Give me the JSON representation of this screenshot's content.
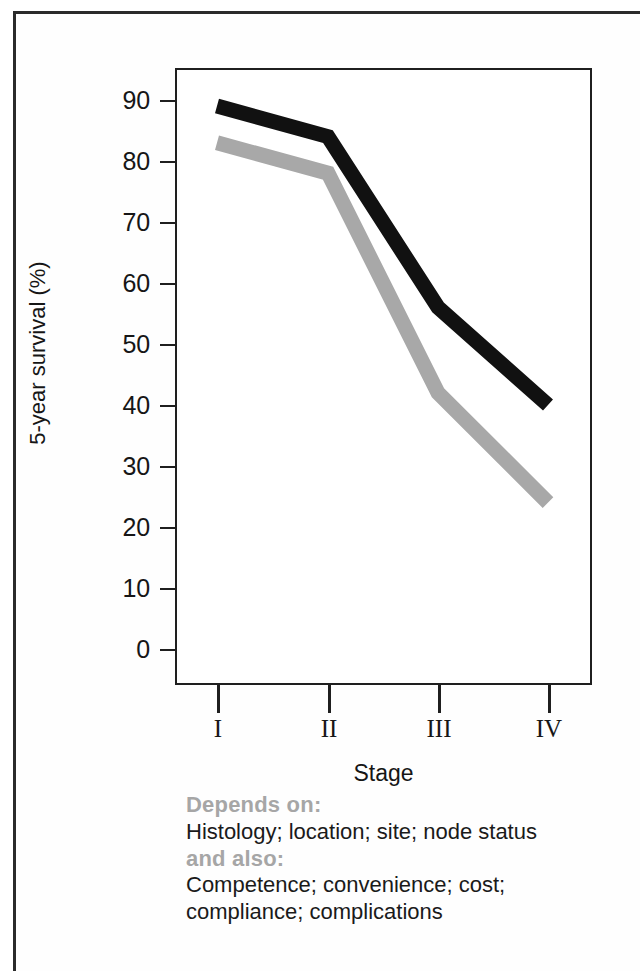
{
  "figure": {
    "axis_color": "#1f1f1f",
    "series_colors": {
      "primary": "#111111",
      "secondary": "#a8a8a8"
    },
    "annotation_heading_color": "#a6a6a6"
  },
  "chart_data": {
    "type": "line",
    "title": "",
    "xlabel": "Stage",
    "ylabel": "5-year survival (%)",
    "categories": [
      "I",
      "II",
      "III",
      "IV"
    ],
    "x_tick_labels": [
      "I",
      "II",
      "III",
      "IV"
    ],
    "y_tick_labels": [
      "0",
      "10",
      "20",
      "30",
      "40",
      "50",
      "60",
      "70",
      "80",
      "90"
    ],
    "y_ticks": [
      0,
      10,
      20,
      30,
      40,
      50,
      60,
      70,
      80,
      90
    ],
    "ylim": [
      -5,
      95
    ],
    "grid": false,
    "legend": "none",
    "series": [
      {
        "name": "upper",
        "color": "#111111",
        "values": [
          89,
          84,
          56,
          40
        ]
      },
      {
        "name": "lower",
        "color": "#a8a8a8",
        "values": [
          83,
          78,
          42,
          24
        ]
      }
    ]
  },
  "annotations": {
    "line1_heading": "Depends on:",
    "line2_body": "Histology; location; site; node status",
    "line3_heading": "and also:",
    "line4_body": "Competence; convenience; cost;",
    "line5_body": "compliance; complications"
  }
}
